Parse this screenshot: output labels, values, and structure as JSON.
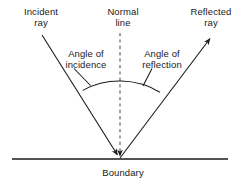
{
  "diagram": {
    "labels": {
      "incident_ray": "Incident\nray",
      "normal_line": "Normal\nline",
      "reflected_ray": "Reflected\nray",
      "angle_of_incidence": "Angle of\nincidence",
      "angle_of_reflection": "Angle of\nreflection",
      "boundary": "Boundary"
    },
    "colors": {
      "stroke": "#1a1a1a",
      "text": "#1a1a1a",
      "background": "#ffffff",
      "normal_dash": "#555555"
    },
    "geometry": {
      "incidence_point": {
        "x": 120,
        "y": 158
      },
      "incident_ray_start": {
        "x": 42,
        "y": 35
      },
      "reflected_ray_end": {
        "x": 212,
        "y": 37
      },
      "normal_top": {
        "x": 120,
        "y": 33
      },
      "boundary_left": {
        "x": 12,
        "y": 159
      },
      "boundary_right": {
        "x": 228,
        "y": 159
      },
      "arc_radius": 78
    }
  }
}
